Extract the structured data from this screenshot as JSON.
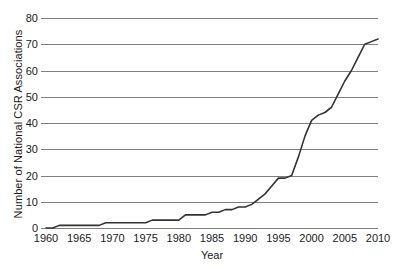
{
  "chart_data": {
    "type": "line",
    "title": "",
    "xlabel": "Year",
    "ylabel": "Number of National CSR Associations",
    "xlim": [
      1960,
      2010
    ],
    "ylim": [
      0,
      80
    ],
    "grid": "horizontal",
    "legend": "none",
    "line_color": "#333333",
    "grid_color": "#808080",
    "background": "#ffffff",
    "xticks": [
      1960,
      1965,
      1970,
      1975,
      1980,
      1985,
      1990,
      1995,
      2000,
      2005,
      2010
    ],
    "yticks": [
      0,
      10,
      20,
      30,
      40,
      50,
      60,
      70,
      80
    ],
    "xtick_labels": [
      "1960",
      "1965",
      "1970",
      "1975",
      "1980",
      "1985",
      "1990",
      "1995",
      "2000",
      "2005",
      "2010"
    ],
    "ytick_labels": [
      "0",
      "10",
      "20",
      "30",
      "40",
      "50",
      "60",
      "70",
      "80"
    ],
    "series": [
      {
        "name": "National CSR Associations",
        "x": [
          1960,
          1961,
          1962,
          1963,
          1964,
          1965,
          1966,
          1967,
          1968,
          1969,
          1970,
          1971,
          1972,
          1973,
          1974,
          1975,
          1976,
          1977,
          1978,
          1979,
          1980,
          1981,
          1982,
          1983,
          1984,
          1985,
          1986,
          1987,
          1988,
          1989,
          1990,
          1991,
          1992,
          1993,
          1994,
          1995,
          1996,
          1997,
          1998,
          1999,
          2000,
          2001,
          2002,
          2003,
          2004,
          2005,
          2006,
          2007,
          2008,
          2009,
          2010
        ],
        "values": [
          0,
          0,
          1,
          1,
          1,
          1,
          1,
          1,
          1,
          2,
          2,
          2,
          2,
          2,
          2,
          2,
          3,
          3,
          3,
          3,
          3,
          5,
          5,
          5,
          5,
          6,
          6,
          7,
          7,
          8,
          8,
          9,
          11,
          13,
          16,
          19,
          19,
          20,
          27,
          35,
          41,
          43,
          44,
          46,
          51,
          56,
          60,
          65,
          70,
          71,
          72
        ]
      }
    ]
  }
}
